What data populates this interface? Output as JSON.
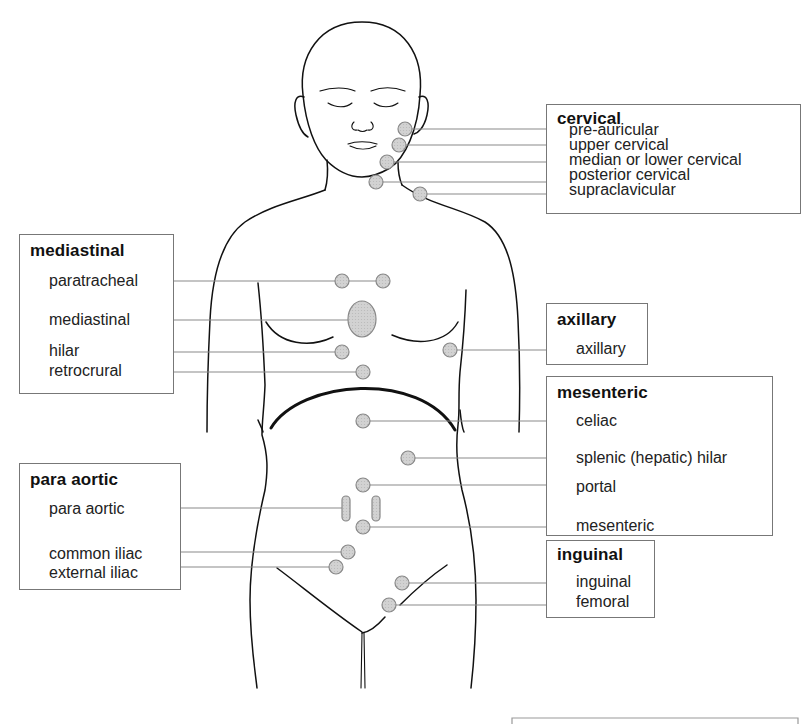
{
  "figure": {
    "type": "lymph node region anatomical diagram",
    "colors": {
      "outline": "#111111",
      "leader_line": "#8a8a8a",
      "node_fill": "#cfcfcf",
      "node_stroke": "#888888",
      "box_border": "#777777"
    }
  },
  "groups": {
    "cervical": {
      "title": "cervical",
      "items": [
        "pre-auricular",
        "upper cervical",
        "median or lower cervical",
        "posterior cervical",
        "supraclavicular"
      ]
    },
    "mediastinal": {
      "title": "mediastinal",
      "items": [
        "paratracheal",
        "mediastinal",
        "hilar",
        "retrocrural"
      ]
    },
    "axillary": {
      "title": "axillary",
      "items": [
        "axillary"
      ]
    },
    "mesenteric": {
      "title": "mesenteric",
      "items": [
        "celiac",
        "splenic (hepatic) hilar",
        "portal",
        "mesenteric"
      ]
    },
    "para_aortic": {
      "title": "para aortic",
      "items": [
        "para aortic",
        "common iliac",
        "external iliac"
      ]
    },
    "inguinal": {
      "title": "inguinal",
      "items": [
        "inguinal",
        "femoral"
      ]
    }
  }
}
